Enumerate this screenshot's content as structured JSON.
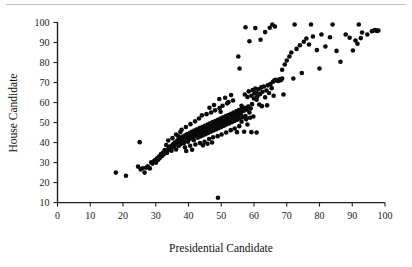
{
  "chart_data": {
    "type": "scatter",
    "title": "",
    "xlabel": "Presidential Candidate",
    "ylabel": "House Candidate",
    "xlim": [
      0,
      100
    ],
    "ylim": [
      10,
      100
    ],
    "xticks": [
      0,
      10,
      20,
      30,
      40,
      50,
      60,
      70,
      80,
      90,
      100
    ],
    "yticks": [
      10,
      20,
      30,
      40,
      50,
      60,
      70,
      80,
      90,
      100
    ],
    "xtick_labels": [
      "0",
      "10",
      "20",
      "30",
      "40",
      "50",
      "60",
      "70",
      "80",
      "90",
      "100"
    ],
    "ytick_labels": [
      "10",
      "20",
      "30",
      "40",
      "50",
      "60",
      "70",
      "80",
      "90",
      "100"
    ],
    "grid": false,
    "legend": "none",
    "marker": "filled-circle",
    "marker_color": "#0a0a0a",
    "marker_size": 2.3,
    "series": [
      {
        "name": "districts",
        "points": [
          [
            17.8,
            25.0
          ],
          [
            20.9,
            23.4
          ],
          [
            24.6,
            28.0
          ],
          [
            25.1,
            40.2
          ],
          [
            25.4,
            26.6
          ],
          [
            26.0,
            27.2
          ],
          [
            26.6,
            25.0
          ],
          [
            27.1,
            27.5
          ],
          [
            27.6,
            28.1
          ],
          [
            28.2,
            27.1
          ],
          [
            28.6,
            30.2
          ],
          [
            29.0,
            29.5
          ],
          [
            29.4,
            30.6
          ],
          [
            29.8,
            31.3
          ],
          [
            30.1,
            30.0
          ],
          [
            30.4,
            32.1
          ],
          [
            30.8,
            31.5
          ],
          [
            31.0,
            33.0
          ],
          [
            31.3,
            32.4
          ],
          [
            31.6,
            34.2
          ],
          [
            31.9,
            33.3
          ],
          [
            32.2,
            35.0
          ],
          [
            32.4,
            34.0
          ],
          [
            32.7,
            36.3
          ],
          [
            33.0,
            35.4
          ],
          [
            33.2,
            38.8
          ],
          [
            33.4,
            34.8
          ],
          [
            33.7,
            36.0
          ],
          [
            33.9,
            37.1
          ],
          [
            34.1,
            36.6
          ],
          [
            34.3,
            38.0
          ],
          [
            34.6,
            37.3
          ],
          [
            34.8,
            35.9
          ],
          [
            35.0,
            38.6
          ],
          [
            35.2,
            37.8
          ],
          [
            35.4,
            39.3
          ],
          [
            35.6,
            38.2
          ],
          [
            35.8,
            40.0
          ],
          [
            36.0,
            39.0
          ],
          [
            36.2,
            36.5
          ],
          [
            36.4,
            40.6
          ],
          [
            36.6,
            39.6
          ],
          [
            36.8,
            41.2
          ],
          [
            37.0,
            38.3
          ],
          [
            37.2,
            40.2
          ],
          [
            37.4,
            41.8
          ],
          [
            37.6,
            39.2
          ],
          [
            37.8,
            42.4
          ],
          [
            38.0,
            40.8
          ],
          [
            38.2,
            43.0
          ],
          [
            38.4,
            41.4
          ],
          [
            38.6,
            39.8
          ],
          [
            38.8,
            42.0
          ],
          [
            39.0,
            43.6
          ],
          [
            39.2,
            41.0
          ],
          [
            39.4,
            42.6
          ],
          [
            39.6,
            44.2
          ],
          [
            39.8,
            40.4
          ],
          [
            40.0,
            43.2
          ],
          [
            40.2,
            41.6
          ],
          [
            40.4,
            44.8
          ],
          [
            40.6,
            42.2
          ],
          [
            40.8,
            43.8
          ],
          [
            41.0,
            45.4
          ],
          [
            41.2,
            42.8
          ],
          [
            41.4,
            44.4
          ],
          [
            41.6,
            41.2
          ],
          [
            41.8,
            46.0
          ],
          [
            42.0,
            43.4
          ],
          [
            42.2,
            45.0
          ],
          [
            42.4,
            44.0
          ],
          [
            42.6,
            46.6
          ],
          [
            42.8,
            42.4
          ],
          [
            43.0,
            45.6
          ],
          [
            43.2,
            44.6
          ],
          [
            43.4,
            47.2
          ],
          [
            43.6,
            43.0
          ],
          [
            43.8,
            46.2
          ],
          [
            44.0,
            45.2
          ],
          [
            44.2,
            47.8
          ],
          [
            44.4,
            43.6
          ],
          [
            44.6,
            46.8
          ],
          [
            44.8,
            45.8
          ],
          [
            45.0,
            48.4
          ],
          [
            45.2,
            44.2
          ],
          [
            45.4,
            47.4
          ],
          [
            45.6,
            46.4
          ],
          [
            45.8,
            49.0
          ],
          [
            46.0,
            44.8
          ],
          [
            46.2,
            48.0
          ],
          [
            46.4,
            47.0
          ],
          [
            46.6,
            49.6
          ],
          [
            46.8,
            45.4
          ],
          [
            47.0,
            48.6
          ],
          [
            47.2,
            47.6
          ],
          [
            47.4,
            50.2
          ],
          [
            47.6,
            46.0
          ],
          [
            47.8,
            49.2
          ],
          [
            48.0,
            48.2
          ],
          [
            48.2,
            50.8
          ],
          [
            48.4,
            46.6
          ],
          [
            48.6,
            49.8
          ],
          [
            48.8,
            48.8
          ],
          [
            49.0,
            51.4
          ],
          [
            49.0,
            12.4
          ],
          [
            49.2,
            47.2
          ],
          [
            49.4,
            50.4
          ],
          [
            49.6,
            49.4
          ],
          [
            49.8,
            52.0
          ],
          [
            50.0,
            47.8
          ],
          [
            50.2,
            51.0
          ],
          [
            50.4,
            50.0
          ],
          [
            50.6,
            52.6
          ],
          [
            50.8,
            48.4
          ],
          [
            51.0,
            51.6
          ],
          [
            51.2,
            50.6
          ],
          [
            51.4,
            53.2
          ],
          [
            51.6,
            49.0
          ],
          [
            51.8,
            52.2
          ],
          [
            52.0,
            51.2
          ],
          [
            52.2,
            53.8
          ],
          [
            52.4,
            49.6
          ],
          [
            52.6,
            52.8
          ],
          [
            52.8,
            51.8
          ],
          [
            53.0,
            54.4
          ],
          [
            53.2,
            50.2
          ],
          [
            53.4,
            53.4
          ],
          [
            53.6,
            52.4
          ],
          [
            53.8,
            55.0
          ],
          [
            54.0,
            50.8
          ],
          [
            54.2,
            54.0
          ],
          [
            54.4,
            53.0
          ],
          [
            54.6,
            55.6
          ],
          [
            54.8,
            51.4
          ],
          [
            55.0,
            54.6
          ],
          [
            55.2,
            53.6
          ],
          [
            55.4,
            56.2
          ],
          [
            55.6,
            52.0
          ],
          [
            55.8,
            55.2
          ],
          [
            56.0,
            54.2
          ],
          [
            56.2,
            56.8
          ],
          [
            56.5,
            52.6
          ],
          [
            56.8,
            55.8
          ],
          [
            57.0,
            57.4
          ],
          [
            57.4,
            53.2
          ],
          [
            57.8,
            56.4
          ],
          [
            58.2,
            58.0
          ],
          [
            58.6,
            55.0
          ],
          [
            59.0,
            57.0
          ],
          [
            59.4,
            59.2
          ],
          [
            36.2,
            44.0
          ],
          [
            37.5,
            45.3
          ],
          [
            38.9,
            37.6
          ],
          [
            40.5,
            38.4
          ],
          [
            42.1,
            39.0
          ],
          [
            43.5,
            39.8
          ],
          [
            44.9,
            40.4
          ],
          [
            46.3,
            41.8
          ],
          [
            47.5,
            42.6
          ],
          [
            48.9,
            43.2
          ],
          [
            33.8,
            41.0
          ],
          [
            35.1,
            42.2
          ],
          [
            36.9,
            43.1
          ],
          [
            39.3,
            35.8
          ],
          [
            41.1,
            36.4
          ],
          [
            44.1,
            53.6
          ],
          [
            45.5,
            54.2
          ],
          [
            46.9,
            55.0
          ],
          [
            48.1,
            56.1
          ],
          [
            49.5,
            57.2
          ],
          [
            43.2,
            52.0
          ],
          [
            42.0,
            50.6
          ],
          [
            40.6,
            49.2
          ],
          [
            39.2,
            47.8
          ],
          [
            37.9,
            46.4
          ],
          [
            50.1,
            44.0
          ],
          [
            51.5,
            45.0
          ],
          [
            52.9,
            46.2
          ],
          [
            54.1,
            47.0
          ],
          [
            55.5,
            48.2
          ],
          [
            47.2,
            40.0
          ],
          [
            45.8,
            39.4
          ],
          [
            44.4,
            38.6
          ],
          [
            50.4,
            58.4
          ],
          [
            51.8,
            59.6
          ],
          [
            52.2,
            60.2
          ],
          [
            53.6,
            61.0
          ],
          [
            49.4,
            61.8
          ],
          [
            47.8,
            58.8
          ],
          [
            46.4,
            57.4
          ],
          [
            54.8,
            45.2
          ],
          [
            56.2,
            50.4
          ],
          [
            57.6,
            51.6
          ],
          [
            58.8,
            52.4
          ],
          [
            59.8,
            53.0
          ],
          [
            55.2,
            83.0
          ],
          [
            55.6,
            77.0
          ],
          [
            53.0,
            63.8
          ],
          [
            51.2,
            62.4
          ],
          [
            49.8,
            55.4
          ],
          [
            57.2,
            64.0
          ],
          [
            58.0,
            62.8
          ],
          [
            58.4,
            65.6
          ],
          [
            59.2,
            63.4
          ],
          [
            59.6,
            66.2
          ],
          [
            60.0,
            62.0
          ],
          [
            60.2,
            64.6
          ],
          [
            60.4,
            67.0
          ],
          [
            60.6,
            65.0
          ],
          [
            60.8,
            61.4
          ],
          [
            61.0,
            63.0
          ],
          [
            61.4,
            66.6
          ],
          [
            61.8,
            64.2
          ],
          [
            62.2,
            67.6
          ],
          [
            62.6,
            65.4
          ],
          [
            63.0,
            68.0
          ],
          [
            63.4,
            62.6
          ],
          [
            63.8,
            66.0
          ],
          [
            64.2,
            68.6
          ],
          [
            64.6,
            64.8
          ],
          [
            65.0,
            69.2
          ],
          [
            65.4,
            67.2
          ],
          [
            65.8,
            70.4
          ],
          [
            66.2,
            71.0
          ],
          [
            66.6,
            71.4
          ],
          [
            67.0,
            71.0
          ],
          [
            67.4,
            70.8
          ],
          [
            67.8,
            71.6
          ],
          [
            68.2,
            71.2
          ],
          [
            68.6,
            72.0
          ],
          [
            59.2,
            45.2
          ],
          [
            60.8,
            45.0
          ],
          [
            58.0,
            49.0
          ],
          [
            57.0,
            45.4
          ],
          [
            56.2,
            58.4
          ],
          [
            58.6,
            90.6
          ],
          [
            57.4,
            97.6
          ],
          [
            60.4,
            97.2
          ],
          [
            62.0,
            91.4
          ],
          [
            63.4,
            95.2
          ],
          [
            64.8,
            97.4
          ],
          [
            65.6,
            99.0
          ],
          [
            66.4,
            98.0
          ],
          [
            68.6,
            76.4
          ],
          [
            69.4,
            79.0
          ],
          [
            70.0,
            81.0
          ],
          [
            70.8,
            83.0
          ],
          [
            71.4,
            85.0
          ],
          [
            72.0,
            72.0
          ],
          [
            72.4,
            99.0
          ],
          [
            73.0,
            86.8
          ],
          [
            74.0,
            88.6
          ],
          [
            74.6,
            74.8
          ],
          [
            75.2,
            90.4
          ],
          [
            76.0,
            92.0
          ],
          [
            76.8,
            89.0
          ],
          [
            77.4,
            99.0
          ],
          [
            78.0,
            93.0
          ],
          [
            79.2,
            86.2
          ],
          [
            80.0,
            77.0
          ],
          [
            80.6,
            94.0
          ],
          [
            81.8,
            88.0
          ],
          [
            83.2,
            92.6
          ],
          [
            84.0,
            99.0
          ],
          [
            85.2,
            85.8
          ],
          [
            86.4,
            80.4
          ],
          [
            88.0,
            94.0
          ],
          [
            89.2,
            92.4
          ],
          [
            90.2,
            86.0
          ],
          [
            91.0,
            91.0
          ],
          [
            91.6,
            89.4
          ],
          [
            92.0,
            99.0
          ],
          [
            92.6,
            92.2
          ],
          [
            93.0,
            95.0
          ],
          [
            94.6,
            94.0
          ],
          [
            96.0,
            95.6
          ],
          [
            96.6,
            96.0
          ],
          [
            97.0,
            96.2
          ],
          [
            97.6,
            95.8
          ],
          [
            98.0,
            96.0
          ],
          [
            69.0,
            64.0
          ],
          [
            66.0,
            63.4
          ],
          [
            64.0,
            58.6
          ],
          [
            62.4,
            58.2
          ],
          [
            61.6,
            59.0
          ]
        ]
      }
    ]
  },
  "axes": {
    "x_title": "Presidential Candidate",
    "y_title": "House Candidate"
  }
}
